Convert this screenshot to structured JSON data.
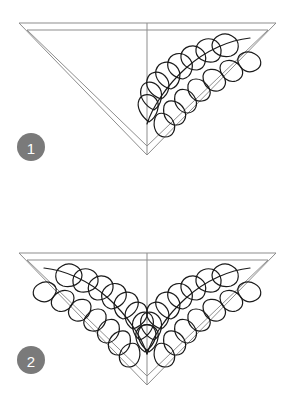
{
  "page": {
    "background_color": "#ffffff",
    "width": 295,
    "height": 401
  },
  "style": {
    "outline_color": "#8d8d8d",
    "outline_width": 1,
    "motif_color": "#1a1a1a",
    "motif_width": 1.2,
    "badge_fill": "#7a7a7a",
    "badge_text_color": "#ffffff",
    "badge_radius": 14
  },
  "steps": [
    {
      "id": "step-1",
      "number": "1",
      "badge": {
        "cx": 31,
        "cy": 147,
        "r": 14
      },
      "shape": {
        "name": "inverted-triangle",
        "outer": {
          "left_x": 19,
          "right_x": 276,
          "top_y": 23,
          "apex_x": 147,
          "apex_y": 155
        },
        "inner": {
          "left_x": 27,
          "right_x": 268,
          "top_y": 30,
          "apex_x": 147,
          "apex_y": 146
        },
        "center_line": {
          "x": 147,
          "y_top": 23,
          "y_bottom": 155
        }
      },
      "motif": {
        "name": "feather-plume",
        "sides": [
          "right"
        ],
        "petal_count_outer": 8,
        "petal_count_inner": 7,
        "spine_from": [
          147,
          124
        ],
        "spine_to": [
          253,
          42
        ]
      }
    },
    {
      "id": "step-2",
      "number": "2",
      "badge": {
        "cx": 31,
        "cy": 360,
        "r": 14
      },
      "shape": {
        "name": "inverted-triangle",
        "outer": {
          "left_x": 19,
          "right_x": 276,
          "top_y": 253,
          "apex_x": 147,
          "apex_y": 385
        },
        "inner": {
          "left_x": 27,
          "right_x": 268,
          "top_y": 260,
          "apex_x": 147,
          "apex_y": 376
        },
        "center_line": {
          "x": 147,
          "y_top": 253,
          "y_bottom": 385
        }
      },
      "motif": {
        "name": "feather-plume-mirrored-pair",
        "sides": [
          "left",
          "right"
        ],
        "petal_count_outer": 8,
        "petal_count_inner": 7,
        "spine_from": [
          147,
          354
        ],
        "spine_to": [
          253,
          272
        ]
      }
    }
  ]
}
